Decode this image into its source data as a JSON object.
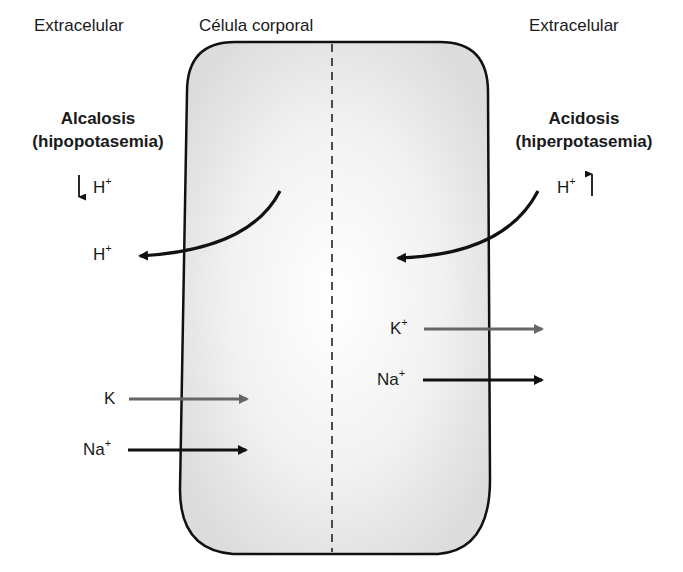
{
  "headers": {
    "left": "Extracelular",
    "center": "Célula corporal",
    "right": "Extracelular"
  },
  "left_condition": {
    "title": "Alcalosis",
    "subtitle": "(hipopotasemia)",
    "h_indicator": {
      "ion": "H",
      "charge": "+",
      "direction": "down"
    },
    "h_out": {
      "ion": "H",
      "charge": "+"
    },
    "k_in": {
      "ion": "K",
      "charge": ""
    },
    "na_in": {
      "ion": "Na",
      "charge": "+"
    }
  },
  "right_condition": {
    "title": "Acidosis",
    "subtitle": "(hiperpotasemia)",
    "h_indicator": {
      "ion": "H",
      "charge": "+",
      "direction": "up"
    },
    "k_out": {
      "ion": "K",
      "charge": "+"
    },
    "na_out": {
      "ion": "Na",
      "charge": "+"
    }
  },
  "colors": {
    "cell_fill": "#e9e9e9",
    "outline": "#111111",
    "k_arrow": "#666666",
    "na_arrow": "#111111"
  }
}
